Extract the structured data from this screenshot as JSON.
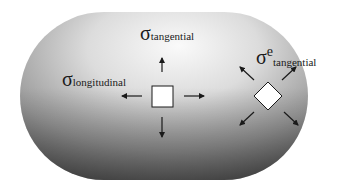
{
  "diagram": {
    "type": "stress-element-illustration",
    "shape": "capsule (cylindrical pressure vessel with hemispherical ends)",
    "labels": {
      "tangential": {
        "symbol": "σ",
        "subscript": "tangential"
      },
      "longitudinal": {
        "symbol": "σ",
        "subscript": "longitudinal"
      },
      "end_tangential": {
        "symbol": "σ",
        "superscript": "e",
        "subscript": "tangential"
      }
    },
    "elements": [
      {
        "name": "cylinder-stress-element",
        "shape": "square",
        "arrows": [
          "up",
          "down",
          "left",
          "right"
        ]
      },
      {
        "name": "end-cap-stress-element",
        "shape": "diamond",
        "arrows": [
          "up-left",
          "up-right",
          "down-left",
          "down-right"
        ]
      }
    ],
    "colors": {
      "background": "#ffffff",
      "vessel_light": "#f4f4f4",
      "vessel_dark": "#5a5a5a",
      "ink": "#1a1a1a",
      "element_fill": "#ffffff"
    }
  }
}
